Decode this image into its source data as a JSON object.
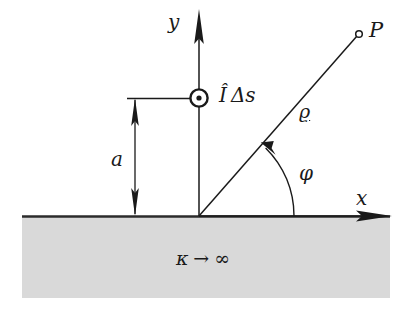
{
  "figure": {
    "background_color": "#ffffff",
    "line_color": "#1a1a1a",
    "ground_fill_color": "#d9d9d9",
    "ground_edge_color": "#2b2b2b"
  },
  "labels": {
    "y_axis": "y",
    "x_axis": "x",
    "field_point": "P",
    "height": "a",
    "radial_distance": "ϱ",
    "angle": "φ",
    "source_current": "Î",
    "source_element": "Δs",
    "conductivity_symbol": "κ",
    "conductivity_arrow": "→",
    "conductivity_limit": "∞"
  },
  "geometry": {
    "origin": {
      "x": 199,
      "y": 216
    },
    "y_axis_tip": {
      "x": 199,
      "y": 10
    },
    "x_axis_tip": {
      "x": 392,
      "y": 216
    },
    "source_marker": {
      "x": 199,
      "y": 98,
      "outer_radius": 9,
      "inner_radius": 2.6
    },
    "point_P": {
      "x": 359,
      "y": 34,
      "radius": 3.2
    },
    "height_dimension": {
      "x": 135,
      "top": 98,
      "bottom": 216
    },
    "extension_line": {
      "y": 98,
      "x_start": 127,
      "x_end": 190
    },
    "angle_arc_radius": 95,
    "angle_degrees": 49,
    "ground": {
      "x": 22,
      "y": 216,
      "width": 368,
      "height": 82
    }
  }
}
